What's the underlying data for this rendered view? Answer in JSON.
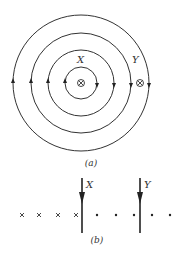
{
  "figure_a": {
    "caption": "(a)",
    "center": [
      81,
      83
    ],
    "radii": [
      16,
      33,
      50,
      68
    ],
    "labels": {
      "x": "X",
      "y": "Y"
    },
    "wire_x_symbol": "into-page",
    "wire_y_symbol": "into-page",
    "field_direction": "clockwise"
  },
  "figure_b": {
    "caption": "(b)",
    "wire_labels": {
      "x": "X",
      "y": "Y"
    },
    "field_row": {
      "crosses": 4,
      "dots": 5
    },
    "current_direction": "down"
  },
  "colors": {
    "ink": "#222222",
    "background": "#ffffff"
  }
}
